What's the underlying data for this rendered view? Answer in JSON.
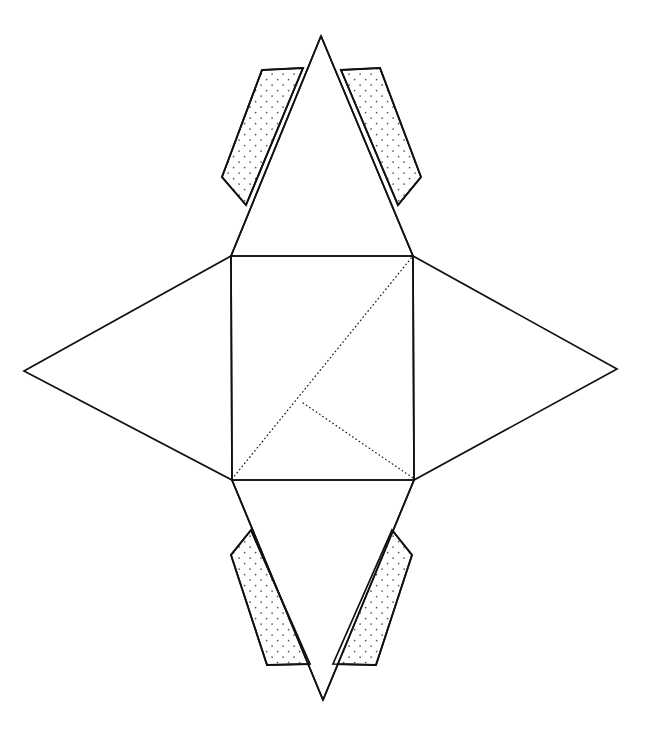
{
  "document": {
    "title": "Geometric Net Diagram",
    "kind": "foldable-net-line-drawing",
    "background_color": "#ffffff",
    "line_color": "#111111",
    "canvas": {
      "width": 645,
      "height": 730
    }
  },
  "figure": {
    "name": "square-pyramid-net",
    "stroke_color": "#111111",
    "dotted_color": "#1a1a1a",
    "tab_fill_color": "#ffffff",
    "stipple_dot_color": "#444444"
  },
  "geometry": {
    "center_quad": {
      "name": "central-square-face",
      "points": "231,256 413,256 414,480 232,480",
      "corners": {
        "top_left": [
          231,
          256
        ],
        "top_right": [
          413,
          256
        ],
        "bottom_right": [
          414,
          480
        ],
        "bottom_left": [
          232,
          480
        ]
      }
    },
    "triangles": [
      {
        "name": "top-triangle-face",
        "points": "231,256 413,256 321,36"
      },
      {
        "name": "bottom-triangle-face",
        "points": "232,480 414,480 323,700"
      },
      {
        "name": "left-triangle-face",
        "points": "231,256 232,480 24,371"
      },
      {
        "name": "right-triangle-face",
        "points": "413,256 414,480 617,369"
      }
    ],
    "tabs": [
      {
        "name": "tab-top-left",
        "points": "262,70 303,68 246,205 222,177"
      },
      {
        "name": "tab-top-right",
        "points": "380,68 341,70 398,205 421,177"
      },
      {
        "name": "tab-bottom-left",
        "points": "251,530 231,555 267,665 310,664"
      },
      {
        "name": "tab-bottom-right",
        "points": "392,530 412,555 376,665 333,664"
      }
    ],
    "fold_lines_dotted": [
      {
        "name": "fold-diagonal-main",
        "from": [
          232,
          479
        ],
        "to": [
          412,
          257
        ]
      },
      {
        "name": "fold-diagonal-short",
        "from": [
          303,
          403
        ],
        "to": [
          413,
          478
        ]
      }
    ]
  },
  "stipple": {
    "name": "tab-stipple-pattern",
    "spacing": 11,
    "dot_radius": 0.85
  }
}
